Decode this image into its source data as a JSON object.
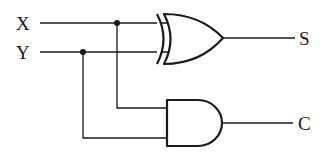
{
  "diagram": {
    "type": "half-adder logic circuit",
    "inputs": [
      {
        "label": "X"
      },
      {
        "label": "Y"
      }
    ],
    "gates": [
      {
        "type": "XOR",
        "inputs": [
          "X",
          "Y"
        ],
        "output": "S"
      },
      {
        "type": "AND",
        "inputs": [
          "X",
          "Y"
        ],
        "output": "C"
      }
    ],
    "outputs": [
      {
        "label": "S"
      },
      {
        "label": "C"
      }
    ],
    "colors": {
      "line": "#1a1a1a",
      "background": "#ffffff"
    }
  }
}
